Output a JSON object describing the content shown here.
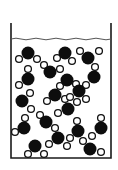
{
  "diagram": {
    "colors": {
      "background": "#ffffff",
      "outline": "#1a1a1a",
      "oxygen": "#0d0d0d",
      "hydrogen_fill": "#ffffff",
      "hydrogen_stroke": "#111111",
      "surface": "#555555"
    },
    "beaker": {
      "left": 11,
      "right": 111,
      "top": 23,
      "bottom": 158,
      "surface_y": 39
    },
    "atom_radius": {
      "oxygen": 6.5,
      "hydrogen": 3.4
    },
    "molecules": [
      {
        "o": [
          28,
          53
        ],
        "h": [
          [
            19,
            59
          ],
          [
            37,
            59
          ]
        ]
      },
      {
        "o": [
          65,
          53
        ],
        "h": [
          [
            57,
            58
          ],
          [
            72,
            61
          ]
        ]
      },
      {
        "o": [
          88,
          58
        ],
        "h": [
          [
            80,
            51
          ],
          [
            99,
            51
          ]
        ]
      },
      {
        "o": [
          50,
          72
        ],
        "h": [
          [
            44,
            65
          ],
          [
            60,
            69
          ]
        ]
      },
      {
        "o": [
          28,
          79
        ],
        "h": [
          [
            28,
            69
          ],
          [
            19,
            85
          ]
        ]
      },
      {
        "o": [
          67,
          80
        ],
        "h": [
          [
            60,
            86
          ],
          [
            76,
            84
          ]
        ]
      },
      {
        "o": [
          94,
          77
        ],
        "h": [
          [
            95,
            67
          ],
          [
            86,
            85
          ]
        ]
      },
      {
        "o": [
          22,
          101
        ],
        "h": [
          [
            30,
            93
          ],
          [
            31,
            109
          ]
        ]
      },
      {
        "o": [
          55,
          95
        ],
        "h": [
          [
            47,
            101
          ],
          [
            65,
            99
          ]
        ]
      },
      {
        "o": [
          79,
          91
        ],
        "h": [
          [
            86,
            99
          ],
          [
            70,
            97
          ]
        ]
      },
      {
        "o": [
          68,
          109
        ],
        "h": [
          [
            58,
            113
          ],
          [
            77,
            102
          ]
        ]
      },
      {
        "o": [
          46,
          122
        ],
        "h": [
          [
            40,
            115
          ],
          [
            55,
            128
          ]
        ]
      },
      {
        "o": [
          24,
          128
        ],
        "h": [
          [
            15,
            132
          ],
          [
            25,
            118
          ]
        ]
      },
      {
        "o": [
          78,
          131
        ],
        "h": [
          [
            70,
            138
          ],
          [
            77,
            121
          ]
        ]
      },
      {
        "o": [
          101,
          128
        ],
        "h": [
          [
            101,
            118
          ],
          [
            92,
            136
          ]
        ]
      },
      {
        "o": [
          35,
          146
        ],
        "h": [
          [
            28,
            154
          ],
          [
            44,
            154
          ]
        ]
      },
      {
        "o": [
          58,
          138
        ],
        "h": [
          [
            49,
            144
          ],
          [
            67,
            146
          ]
        ]
      },
      {
        "o": [
          90,
          149
        ],
        "h": [
          [
            83,
            141
          ],
          [
            101,
            152
          ]
        ]
      }
    ]
  }
}
